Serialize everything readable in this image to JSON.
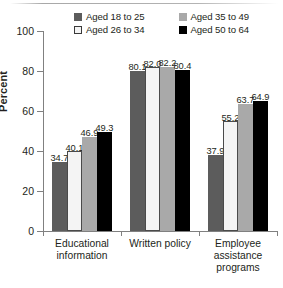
{
  "chart_data": {
    "type": "bar",
    "title": "",
    "xlabel": "",
    "ylabel": "Percent",
    "ylim": [
      0,
      100
    ],
    "yticks": [
      0,
      20,
      40,
      60,
      80,
      100
    ],
    "grid": false,
    "legend_position": "top",
    "categories": [
      "Educational information",
      "Written policy",
      "Employee assistance programs"
    ],
    "series": [
      {
        "name": "Aged 18 to 25",
        "color": "#5c5c5c",
        "values": [
          34.7,
          80.1,
          37.9
        ],
        "labels": [
          "34.7",
          "80.1",
          "37.9"
        ]
      },
      {
        "name": "Aged 26 to 34",
        "color": "#f4f4f4",
        "values": [
          40.1,
          82.0,
          55.2
        ],
        "labels": [
          "40.1",
          "82.0",
          "55.2"
        ]
      },
      {
        "name": "Aged 35 to 49",
        "color": "#a9a9a9",
        "values": [
          46.9,
          82.2,
          63.7
        ],
        "labels": [
          "46.9",
          "82.2",
          "63.7"
        ]
      },
      {
        "name": "Aged 50 to 64",
        "color": "#000000",
        "values": [
          49.3,
          80.4,
          64.9
        ],
        "labels": [
          "49.3",
          "80.4",
          "64.9"
        ]
      }
    ]
  },
  "axis": {
    "y_title": "Percent",
    "y_tick_labels": [
      "0",
      "20",
      "40",
      "60",
      "80",
      "100"
    ]
  },
  "legend": {
    "items": [
      {
        "label": "Aged 18 to 25"
      },
      {
        "label": "Aged 35 to 49"
      },
      {
        "label": "Aged 26 to 34"
      },
      {
        "label": "Aged 50 to 64"
      }
    ]
  },
  "categories": [
    {
      "line1": "Educational",
      "line2": "information",
      "line3": ""
    },
    {
      "line1": "Written policy",
      "line2": "",
      "line3": ""
    },
    {
      "line1": "Employee",
      "line2": "assistance",
      "line3": "programs"
    }
  ],
  "caption": {
    "text": ""
  }
}
